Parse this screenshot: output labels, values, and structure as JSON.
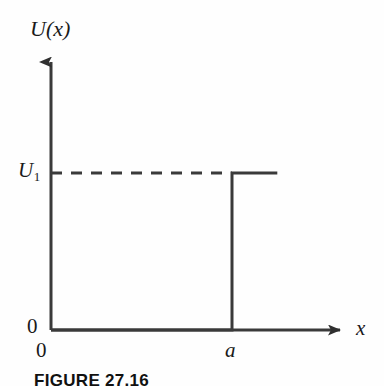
{
  "figure": {
    "caption": "FIGURE 27.16",
    "axes": {
      "y_label": "U(x)",
      "x_label": "x",
      "origin_y_label": "0",
      "origin_x_label": "0",
      "y_tick_label_base": "U",
      "y_tick_label_sub": "1",
      "x_tick_label": "a"
    },
    "colors": {
      "stroke": "#3a3a3a",
      "text": "#1a1a1a",
      "background": "#fefefe"
    }
  },
  "chart_data": {
    "type": "line",
    "title": "",
    "xlabel": "x",
    "ylabel": "U(x)",
    "xlim": [
      0,
      1.32
    ],
    "ylim": [
      0,
      1.4
    ],
    "grid": false,
    "legend": null,
    "x_tick_labels": [
      "0",
      "a"
    ],
    "x_tick_values": [
      0,
      1
    ],
    "y_tick_labels": [
      "0",
      "U₁"
    ],
    "y_tick_values": [
      0,
      1
    ],
    "series": [
      {
        "name": "U(x)",
        "style": "solid",
        "points": [
          {
            "x": 0,
            "y": 0
          },
          {
            "x": 1,
            "y": 0
          },
          {
            "x": 1,
            "y": 1
          },
          {
            "x": 1.25,
            "y": 1
          }
        ]
      },
      {
        "name": "U1 level guide",
        "style": "dashed",
        "points": [
          {
            "x": 0,
            "y": 1
          },
          {
            "x": 1,
            "y": 1
          }
        ]
      }
    ],
    "annotations": [
      {
        "text": "U₁",
        "x": 0,
        "y": 1,
        "position": "left-of-axis"
      },
      {
        "text": "a",
        "x": 1,
        "y": 0,
        "position": "below-axis"
      },
      {
        "text": "0",
        "x": 0,
        "y": 0,
        "position": "left-of-axis"
      },
      {
        "text": "0",
        "x": 0,
        "y": 0,
        "position": "below-axis"
      }
    ]
  }
}
